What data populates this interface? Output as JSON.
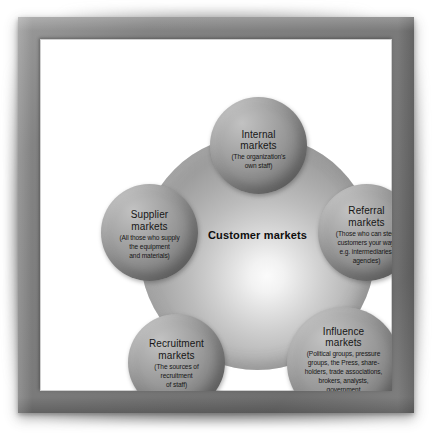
{
  "diagram": {
    "type": "six-markets-model",
    "center": {
      "id": "customer",
      "label": "Customer markets"
    },
    "satellites": [
      {
        "id": "internal",
        "title_line1": "Internal",
        "title_line2": "markets",
        "description_lines": [
          "(The organization's",
          "own staff)"
        ]
      },
      {
        "id": "supplier",
        "title_line1": "Supplier",
        "title_line2": "markets",
        "description_lines": [
          "(All those who supply",
          "the equipment",
          "and materials)"
        ]
      },
      {
        "id": "referral",
        "title_line1": "Referral",
        "title_line2": "markets",
        "description_lines": [
          "(Those who can steer",
          "customers your way,",
          "e.g. intermediaries,",
          "agencies)"
        ]
      },
      {
        "id": "influence",
        "title_line1": "Influence",
        "title_line2": "markets",
        "description_lines": [
          "(Political groups, pressure",
          "groups, the Press, share-",
          "holders, trade associations,",
          "brokers, analysts,",
          "government",
          "departments, etc.)"
        ]
      },
      {
        "id": "recruitment",
        "title_line1": "Recruitment",
        "title_line2": "markets",
        "description_lines": [
          "(The sources of",
          "recruitment",
          "of staff)"
        ]
      }
    ],
    "colors": {
      "frame": "#7a7a7a",
      "canvas": "#ffffff",
      "sphere_mid": "#9a9a9a",
      "sphere_rim": "#5e5e5e",
      "sphere_highlight": "#c2c2c2",
      "center_core": "#fbfbfb",
      "text": "#161616"
    }
  }
}
